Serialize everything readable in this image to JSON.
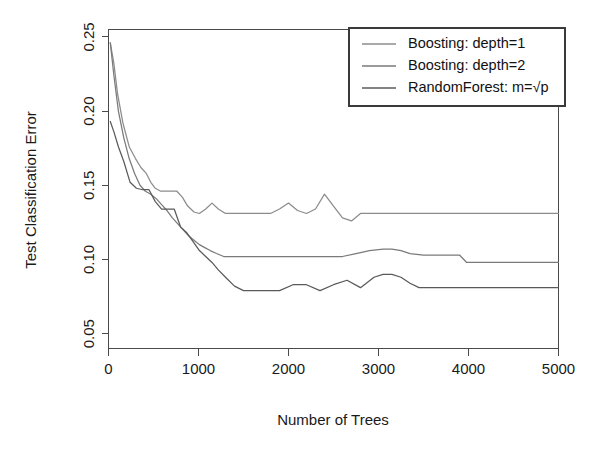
{
  "chart_data": {
    "type": "line",
    "title": "",
    "xlabel": "Number of Trees",
    "ylabel": "Test Classification Error",
    "xlim": [
      0,
      5000
    ],
    "ylim": [
      0.04,
      0.255
    ],
    "grid": false,
    "legend_position": "top-right",
    "xticks": [
      0,
      1000,
      2000,
      3000,
      4000,
      5000
    ],
    "xtick_labels": [
      "0",
      "1000",
      "2000",
      "3000",
      "4000",
      "5000"
    ],
    "yticks": [
      0.05,
      0.1,
      0.15,
      0.2,
      0.25
    ],
    "ytick_labels": [
      "0.05",
      "0.10",
      "0.15",
      "0.20",
      "0.25"
    ],
    "series": [
      {
        "name": "Boosting: depth=1",
        "color": "#8c8c8c",
        "x": [
          20,
          60,
          100,
          160,
          230,
          300,
          360,
          420,
          470,
          520,
          580,
          640,
          700,
          760,
          820,
          880,
          950,
          1010,
          1080,
          1150,
          1220,
          1300,
          1380,
          1450,
          1520,
          1600,
          1700,
          1800,
          1900,
          2000,
          2100,
          2200,
          2300,
          2400,
          2500,
          2600,
          2700,
          2800,
          2900,
          3000,
          3150,
          3300,
          3450,
          3600,
          3800,
          4000,
          4300,
          4600,
          5000
        ],
        "y": [
          0.246,
          0.232,
          0.212,
          0.192,
          0.176,
          0.168,
          0.162,
          0.158,
          0.152,
          0.148,
          0.146,
          0.146,
          0.146,
          0.146,
          0.142,
          0.136,
          0.132,
          0.131,
          0.134,
          0.138,
          0.134,
          0.131,
          0.131,
          0.131,
          0.131,
          0.131,
          0.131,
          0.131,
          0.134,
          0.138,
          0.133,
          0.131,
          0.134,
          0.144,
          0.136,
          0.128,
          0.126,
          0.131,
          0.131,
          0.131,
          0.131,
          0.131,
          0.131,
          0.131,
          0.131,
          0.131,
          0.131,
          0.131,
          0.131
        ]
      },
      {
        "name": "Boosting: depth=2",
        "color": "#7a7a7a",
        "x": [
          20,
          60,
          110,
          170,
          230,
          290,
          350,
          410,
          470,
          530,
          590,
          650,
          710,
          770,
          830,
          890,
          950,
          1010,
          1070,
          1130,
          1200,
          1280,
          1360,
          1440,
          1520,
          1600,
          1700,
          1800,
          1900,
          2000,
          2150,
          2300,
          2450,
          2600,
          2750,
          2900,
          3050,
          3150,
          3250,
          3350,
          3500,
          3700,
          3900,
          3980,
          4200,
          4500,
          4800,
          5000
        ],
        "y": [
          0.246,
          0.224,
          0.2,
          0.182,
          0.168,
          0.158,
          0.15,
          0.146,
          0.144,
          0.141,
          0.137,
          0.133,
          0.128,
          0.124,
          0.12,
          0.116,
          0.113,
          0.11,
          0.108,
          0.106,
          0.104,
          0.102,
          0.102,
          0.102,
          0.102,
          0.102,
          0.102,
          0.102,
          0.102,
          0.102,
          0.102,
          0.102,
          0.102,
          0.102,
          0.104,
          0.106,
          0.107,
          0.107,
          0.106,
          0.104,
          0.103,
          0.103,
          0.103,
          0.098,
          0.098,
          0.098,
          0.098,
          0.098
        ]
      },
      {
        "name": "RandomForest: m=sqrt(p)",
        "color": "#5a5a5a",
        "x": [
          20,
          60,
          110,
          170,
          240,
          310,
          380,
          450,
          520,
          590,
          660,
          730,
          800,
          870,
          940,
          1010,
          1080,
          1150,
          1220,
          1300,
          1400,
          1500,
          1620,
          1750,
          1900,
          2050,
          2200,
          2350,
          2500,
          2650,
          2800,
          2950,
          3050,
          3150,
          3250,
          3350,
          3450,
          3600,
          3800,
          4000,
          4300,
          4600,
          5000
        ],
        "y": [
          0.193,
          0.186,
          0.176,
          0.166,
          0.152,
          0.148,
          0.147,
          0.147,
          0.139,
          0.134,
          0.134,
          0.134,
          0.122,
          0.118,
          0.112,
          0.106,
          0.102,
          0.098,
          0.093,
          0.088,
          0.082,
          0.079,
          0.079,
          0.079,
          0.079,
          0.083,
          0.083,
          0.079,
          0.083,
          0.086,
          0.081,
          0.088,
          0.09,
          0.09,
          0.088,
          0.084,
          0.081,
          0.081,
          0.081,
          0.081,
          0.081,
          0.081,
          0.081
        ]
      }
    ]
  },
  "legend": {
    "entries": [
      {
        "label": "Boosting: depth=1",
        "color": "#8c8c8c"
      },
      {
        "label": "Boosting: depth=2",
        "color": "#7a7a7a"
      },
      {
        "label_prefix": "RandomForest: m=",
        "label_sqrt": "√p",
        "color": "#5a5a5a"
      }
    ]
  },
  "axes": {
    "x_title": "Number of Trees",
    "y_title": "Test Classification Error",
    "x_tick_labels": [
      "0",
      "1000",
      "2000",
      "3000",
      "4000",
      "5000"
    ],
    "y_tick_labels": [
      "0.05",
      "0.10",
      "0.15",
      "0.20",
      "0.25"
    ]
  }
}
